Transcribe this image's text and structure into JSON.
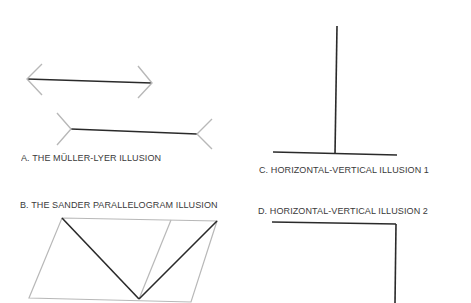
{
  "figures": [
    {
      "id": "A",
      "caption": "A. THE MÜLLER-LYER ILLUSION"
    },
    {
      "id": "B",
      "caption": "B. THE SANDER PARALLELOGRAM ILLUSION"
    },
    {
      "id": "C",
      "caption": "C. HORIZONTAL-VERTICAL ILLUSION 1"
    },
    {
      "id": "D",
      "caption": "D. HORIZONTAL-VERTICAL ILLUSION 2"
    }
  ],
  "colors": {
    "main_line": "#2a2a2a",
    "fin_line": "#b8b8b8",
    "text": "#3a3a3a"
  }
}
